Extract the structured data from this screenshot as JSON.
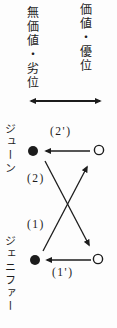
{
  "diagram": {
    "axis_left_label": "無価値・劣位",
    "axis_right_label": "価値・優位",
    "row_top": {
      "name": "ジューン",
      "arrow_label": "(2')"
    },
    "row_bottom": {
      "name": "ジェニファー",
      "arrow_label": "(1')"
    },
    "diagonal_upper_label": "(2)",
    "diagonal_lower_label": "(1)",
    "colors": {
      "ink": "#1c1c1c",
      "background": "#fdfdfd"
    }
  }
}
